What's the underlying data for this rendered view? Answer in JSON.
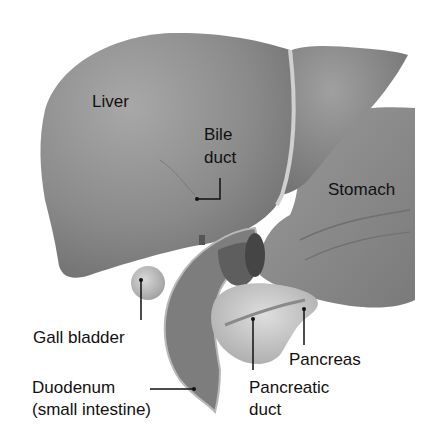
{
  "diagram": {
    "type": "anatomical-illustration",
    "colors": {
      "organ_fill": "#8c8c8c",
      "organ_light": "#b5b5b5",
      "organ_dark": "#5a5a5a",
      "pancreas_fill": "#c9c9c9",
      "text": "#111111",
      "leader_line": "#111111",
      "background": "#ffffff"
    },
    "labels": {
      "liver": "Liver",
      "bile_duct_line1": "Bile",
      "bile_duct_line2": "duct",
      "stomach": "Stomach",
      "gall_bladder": "Gall bladder",
      "pancreas": "Pancreas",
      "duodenum_line1": "Duodenum",
      "duodenum_line2": "(small intestine)",
      "pancreatic_duct_line1": "Pancreatic",
      "pancreatic_duct_line2": "duct"
    }
  }
}
